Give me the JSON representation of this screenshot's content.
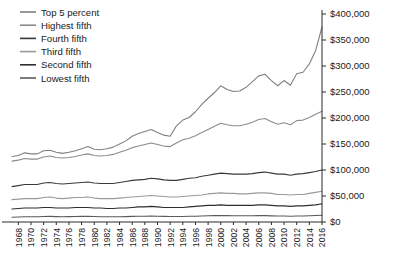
{
  "chart_data": {
    "type": "line",
    "title": "",
    "xlabel": "",
    "ylabel": "",
    "grid": false,
    "legend_position": "top-left",
    "xlim": [
      1967,
      2016
    ],
    "ylim": [
      0,
      400000
    ],
    "yticks": [
      0,
      50000,
      100000,
      150000,
      200000,
      250000,
      300000,
      350000,
      400000
    ],
    "ytick_labels": [
      "$0",
      "$50,000",
      "$100,000",
      "$150,000",
      "$200,000",
      "$250,000",
      "$300,000",
      "$350,000",
      "$400,000"
    ],
    "xtick_labels": [
      "1968",
      "1970",
      "1972",
      "1974",
      "1976",
      "1978",
      "1980",
      "1982",
      "1984",
      "1986",
      "1988",
      "1990",
      "1992",
      "1994",
      "1996",
      "1998",
      "2000",
      "2002",
      "2004",
      "2006",
      "2008",
      "2010",
      "2012",
      "2014",
      "2016"
    ],
    "x": [
      1967,
      1968,
      1969,
      1970,
      1971,
      1972,
      1973,
      1974,
      1975,
      1976,
      1977,
      1978,
      1979,
      1980,
      1981,
      1982,
      1983,
      1984,
      1985,
      1986,
      1987,
      1988,
      1989,
      1990,
      1991,
      1992,
      1993,
      1994,
      1995,
      1996,
      1997,
      1998,
      1999,
      2000,
      2001,
      2002,
      2003,
      2004,
      2005,
      2006,
      2007,
      2008,
      2009,
      2010,
      2011,
      2012,
      2013,
      2014,
      2015,
      2016
    ],
    "series": [
      {
        "name": "Top 5 percent",
        "color": "#808080",
        "width": 1.1,
        "values": [
          126000,
          128000,
          133000,
          131000,
          131000,
          137000,
          138000,
          134000,
          132000,
          134000,
          137000,
          141000,
          145000,
          140000,
          139000,
          141000,
          144000,
          150000,
          156000,
          165000,
          170000,
          174000,
          178000,
          172000,
          167000,
          165000,
          185000,
          196000,
          201000,
          212000,
          226000,
          238000,
          249000,
          262000,
          255000,
          251000,
          252000,
          259000,
          270000,
          281000,
          284000,
          272000,
          262000,
          272000,
          263000,
          285000,
          288000,
          304000,
          330000,
          375000
        ]
      },
      {
        "name": "Highest fifth",
        "color": "#8c8c8c",
        "width": 1.1,
        "values": [
          117000,
          119000,
          122000,
          121000,
          121000,
          125000,
          127000,
          124000,
          123000,
          124000,
          126000,
          129000,
          131000,
          128000,
          127000,
          128000,
          130000,
          134000,
          138000,
          143000,
          146000,
          149000,
          152000,
          149000,
          146000,
          145000,
          152000,
          158000,
          161000,
          166000,
          172000,
          178000,
          184000,
          190000,
          187000,
          185000,
          185000,
          188000,
          192000,
          197000,
          199000,
          193000,
          188000,
          191000,
          187000,
          195000,
          196000,
          201000,
          207000,
          213000
        ]
      },
      {
        "name": "Fourth fifth",
        "color": "#3a3a3a",
        "width": 1.1,
        "values": [
          68000,
          70000,
          72000,
          72000,
          72000,
          75000,
          76000,
          74000,
          73000,
          74000,
          75000,
          76000,
          77000,
          75000,
          74000,
          74000,
          74000,
          76000,
          78000,
          80000,
          81000,
          82000,
          84000,
          83000,
          81000,
          80000,
          80000,
          82000,
          84000,
          85000,
          88000,
          90000,
          92000,
          94000,
          93000,
          92000,
          92000,
          92000,
          93000,
          95000,
          96000,
          94000,
          92000,
          92000,
          90000,
          92000,
          93000,
          95000,
          97000,
          100000
        ]
      },
      {
        "name": "Third fifth",
        "color": "#9a9a9a",
        "width": 1.1,
        "values": [
          43000,
          44000,
          45000,
          45000,
          45000,
          47000,
          48000,
          46000,
          45000,
          46000,
          47000,
          47000,
          48000,
          46000,
          45000,
          45000,
          45000,
          46000,
          47000,
          48000,
          49000,
          50000,
          51000,
          50000,
          49000,
          48000,
          48000,
          49000,
          50000,
          51000,
          52000,
          54000,
          55000,
          56000,
          55000,
          55000,
          54000,
          54000,
          55000,
          56000,
          56000,
          55000,
          53000,
          53000,
          52000,
          53000,
          53000,
          55000,
          57000,
          59000
        ]
      },
      {
        "name": "Second fifth",
        "color": "#2e2e2e",
        "width": 1.1,
        "values": [
          25000,
          26000,
          27000,
          27000,
          27000,
          28000,
          28000,
          27000,
          27000,
          27000,
          28000,
          28000,
          28000,
          27000,
          27000,
          26000,
          26000,
          27000,
          27000,
          28000,
          29000,
          29000,
          30000,
          29000,
          28000,
          28000,
          28000,
          28000,
          29000,
          30000,
          31000,
          32000,
          32000,
          33000,
          32000,
          32000,
          32000,
          32000,
          32000,
          33000,
          33000,
          32000,
          31000,
          31000,
          30000,
          31000,
          31000,
          32000,
          33000,
          35000
        ]
      },
      {
        "name": "Lowest fifth",
        "color": "#5a5a5a",
        "width": 1.1,
        "values": [
          9000,
          9500,
          10000,
          10000,
          10000,
          10500,
          10800,
          10400,
          10200,
          10400,
          10600,
          10800,
          11000,
          10500,
          10200,
          10000,
          10000,
          10200,
          10400,
          10800,
          11000,
          11200,
          11500,
          11200,
          10800,
          10600,
          10500,
          10600,
          11000,
          11200,
          11600,
          12000,
          12200,
          12500,
          12200,
          12000,
          12000,
          12000,
          12000,
          12200,
          12300,
          11800,
          11500,
          11500,
          11200,
          11400,
          11500,
          11900,
          12400,
          13000
        ]
      }
    ]
  },
  "legend": {
    "items": [
      {
        "label": "Top 5 percent"
      },
      {
        "label": "Highest fifth"
      },
      {
        "label": "Fourth fifth"
      },
      {
        "label": "Third fifth"
      },
      {
        "label": "Second fifth"
      },
      {
        "label": "Lowest fifth"
      }
    ]
  }
}
